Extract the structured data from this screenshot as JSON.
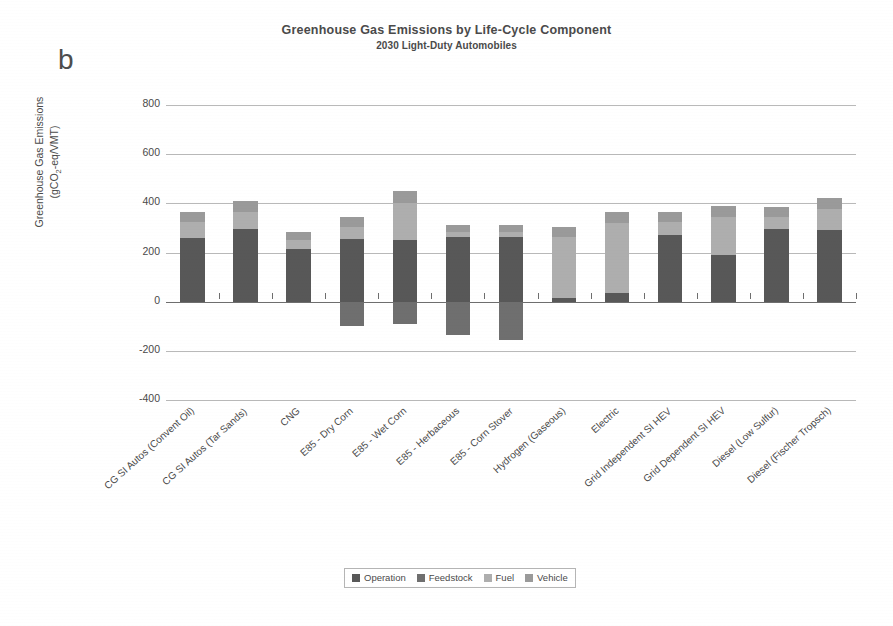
{
  "panel_label": "b",
  "chart_data": {
    "type": "bar",
    "stacked": true,
    "title": "Greenhouse Gas Emissions by Life-Cycle Component",
    "subtitle": "2030 Light-Duty Automobiles",
    "ylabel_line1": "Greenhouse Gas Emissions",
    "ylabel_line2": "(gCO2-eq/VMT)",
    "ylabel_unit_pre": "(gCO",
    "ylabel_unit_sub": "2",
    "ylabel_unit_post": "-eq/VMT)",
    "xlabel": "",
    "ylim": [
      -400,
      800
    ],
    "yticks": [
      800,
      600,
      400,
      200,
      0,
      -200,
      -400
    ],
    "ytick_labels": [
      "800",
      "600",
      "400",
      "200",
      "0",
      "-200",
      "-400"
    ],
    "grid": true,
    "legend_position": "bottom",
    "categories": [
      "CG SI Autos (Convent Oil)",
      "CG SI Autos (Tar Sands)",
      "CNG",
      "E85 - Dry Corn",
      "E85 - Wet Corn",
      "E85 - Herbaceous",
      "E85 - Corn Stover",
      "Hydrogen (Gaseous)",
      "Electric",
      "Grid Independent SI HEV",
      "Grid Dependent SI HEV",
      "Diesel (Low Sulfur)",
      "Diesel (Fischer Tropsch)"
    ],
    "series": [
      {
        "name": "Operation",
        "color": "#585858",
        "values": [
          260,
          295,
          215,
          255,
          250,
          265,
          265,
          15,
          35,
          270,
          190,
          295,
          290
        ]
      },
      {
        "name": "Feedstock",
        "color": "#6f6f6f",
        "values": [
          0,
          0,
          0,
          -100,
          -90,
          -135,
          -155,
          0,
          0,
          0,
          0,
          0,
          0
        ]
      },
      {
        "name": "Fuel",
        "color": "#aeaeae",
        "values": [
          65,
          70,
          35,
          50,
          150,
          20,
          20,
          250,
          285,
          55,
          155,
          50,
          85
        ]
      },
      {
        "name": "Vehicle",
        "color": "#9a9a9a",
        "values": [
          40,
          45,
          35,
          40,
          50,
          25,
          25,
          40,
          45,
          40,
          45,
          40,
          45
        ]
      }
    ],
    "legend_entries": [
      "Operation",
      "Feedstock",
      "Fuel",
      "Vehicle"
    ]
  }
}
